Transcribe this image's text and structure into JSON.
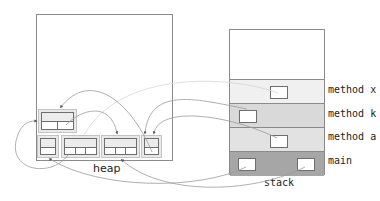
{
  "heap": {
    "label": "heap",
    "objects": [
      {
        "id": "obj-top-left",
        "cells": 2
      },
      {
        "id": "obj-bottom-1",
        "cells": 1
      },
      {
        "id": "obj-bottom-2",
        "cells": 3
      },
      {
        "id": "obj-bottom-3",
        "cells": 3
      },
      {
        "id": "obj-bottom-4",
        "cells": 1
      }
    ]
  },
  "stack": {
    "label": "stack",
    "frames": [
      {
        "label": "method x",
        "color": "#f0f0f0"
      },
      {
        "label": "method k",
        "color": "#d9d9d9"
      },
      {
        "label": "method a",
        "color": "#e2e2e2"
      },
      {
        "label": "main",
        "color": "#a6a6a6"
      }
    ]
  },
  "colors": {
    "border": "#8a8a8a",
    "arrow": "#9a9a9a",
    "arrow_light": "#d4d4d4"
  }
}
